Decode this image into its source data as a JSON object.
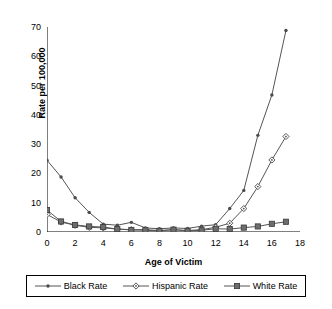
{
  "chart_data": {
    "type": "line",
    "title": "",
    "xlabel": "Age of Victim",
    "ylabel": "Rate per 100,000",
    "xlim": [
      0,
      18
    ],
    "ylim": [
      0,
      70
    ],
    "xticks": [
      0,
      2,
      4,
      6,
      8,
      10,
      12,
      14,
      16,
      18
    ],
    "yticks": [
      0,
      10,
      20,
      30,
      40,
      50,
      60,
      70
    ],
    "grid": false,
    "legend_position": "below-axes",
    "x": [
      0,
      1,
      2,
      3,
      4,
      5,
      6,
      7,
      8,
      9,
      10,
      11,
      12,
      13,
      14,
      15,
      16,
      17
    ],
    "series": [
      {
        "name": "Black Rate",
        "marker": "dot",
        "color": "#555555",
        "values": [
          24.5,
          18.8,
          11.7,
          6.7,
          2.7,
          2.3,
          3.3,
          1.4,
          1.1,
          1.4,
          1.2,
          2.0,
          2.5,
          8.0,
          14.2,
          33.0,
          46.8,
          68.8
        ]
      },
      {
        "name": "Hispanic Rate",
        "marker": "open-diamond",
        "color": "#555555",
        "values": [
          6.0,
          3.4,
          2.3,
          1.6,
          1.4,
          1.0,
          0.8,
          0.8,
          0.5,
          0.8,
          0.5,
          0.8,
          1.6,
          3.0,
          8.0,
          15.5,
          24.6,
          32.6
        ]
      },
      {
        "name": "White Rate",
        "marker": "filled-square",
        "color": "#555555",
        "values": [
          7.5,
          3.6,
          2.4,
          1.9,
          1.7,
          1.0,
          0.7,
          0.6,
          0.4,
          0.8,
          0.4,
          0.6,
          1.1,
          1.0,
          1.5,
          1.9,
          2.8,
          3.5
        ]
      }
    ]
  },
  "legend": {
    "items": [
      {
        "label": "Black Rate"
      },
      {
        "label": "Hispanic Rate"
      },
      {
        "label": "White Rate"
      }
    ]
  }
}
